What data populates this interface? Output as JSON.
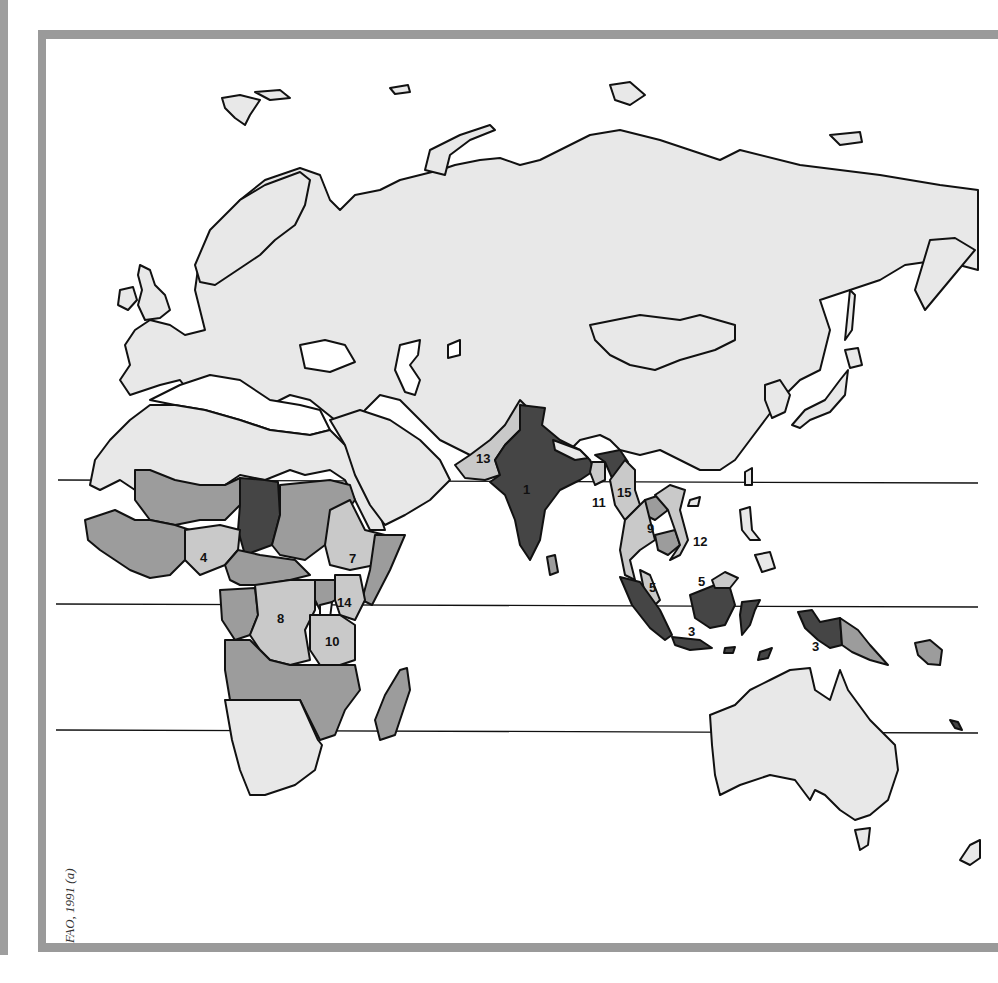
{
  "map": {
    "type": "choropleth",
    "region_shown": "Africa, Europe, Asia and Oceania (Eastern Hemisphere)",
    "credit": "FAO, 1991 (a)",
    "shading_levels": {
      "level_1_lightest": "#e8e8e8",
      "level_2_light": "#c9c9c9",
      "level_3_medium": "#9c9c9c",
      "level_4_dark": "#454545"
    },
    "reference_lines": [
      "Tropic of Cancer",
      "Equator",
      "Tropic of Capricorn"
    ],
    "numbered_labels": [
      {
        "number": "1",
        "location": "India",
        "shade": "level_4_dark"
      },
      {
        "number": "3",
        "location": "Indonesia (Sumatra/Java)",
        "shade": "level_4_dark"
      },
      {
        "number": "3",
        "location": "Indonesia (Irian Jaya)",
        "shade": "level_4_dark"
      },
      {
        "number": "4",
        "location": "Nigeria",
        "shade": "level_2_light"
      },
      {
        "number": "5",
        "location": "Malaysia (Peninsular)",
        "shade": "level_2_light"
      },
      {
        "number": "5",
        "location": "Malaysia (Borneo)",
        "shade": "level_2_light"
      },
      {
        "number": "7",
        "location": "Ethiopia",
        "shade": "level_2_light"
      },
      {
        "number": "8",
        "location": "Zaire",
        "shade": "level_2_light"
      },
      {
        "number": "9",
        "location": "Thailand",
        "shade": "level_2_light"
      },
      {
        "number": "10",
        "location": "Tanzania",
        "shade": "level_2_light"
      },
      {
        "number": "11",
        "location": "Bangladesh",
        "shade": "level_2_light"
      },
      {
        "number": "12",
        "location": "Viet Nam",
        "shade": "level_2_light"
      },
      {
        "number": "13",
        "location": "Pakistan",
        "shade": "level_2_light"
      },
      {
        "number": "14",
        "location": "Kenya",
        "shade": "level_2_light"
      },
      {
        "number": "15",
        "location": "Myanmar",
        "shade": "level_2_light"
      }
    ]
  }
}
